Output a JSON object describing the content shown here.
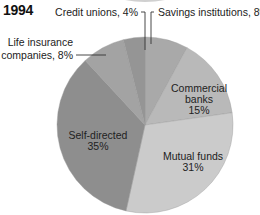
{
  "title": "1994",
  "chart_data": {
    "type": "pie",
    "title": "1994",
    "start_angle_deg": 0,
    "direction": "clockwise",
    "slices": [
      {
        "label": "Savings institutions",
        "value": 8,
        "display": "Savings institutions, 8%",
        "color": "#a9a9a9",
        "label_position": "outside"
      },
      {
        "label": "Commercial banks",
        "value": 15,
        "display": "Commercial banks 15%",
        "color": "#b9b9b9",
        "label_position": "inside"
      },
      {
        "label": "Mutual funds",
        "value": 31,
        "display": "Mutual funds 31%",
        "color": "#cbcbcb",
        "label_position": "inside"
      },
      {
        "label": "Self-directed",
        "value": 35,
        "display": "Self-directed 35%",
        "color": "#8e8e8e",
        "label_position": "inside"
      },
      {
        "label": "Life insurance companies",
        "value": 8,
        "display": "Life insurance companies, 8%",
        "color": "#a3a3a3",
        "label_position": "outside"
      },
      {
        "label": "Credit unions",
        "value": 4,
        "display": "Credit unions, 4%",
        "color": "#959595",
        "label_position": "outside"
      }
    ],
    "units": "%",
    "legend": "none"
  },
  "labels": {
    "savings": "Savings institutions, 8%",
    "credit": "Credit unions, 4%",
    "life_line1": "Life insurance",
    "life_line2": "companies, 8%",
    "commercial_line1": "Commercial",
    "commercial_line2": "banks",
    "commercial_line3": "15%",
    "mutual_line1": "Mutual funds",
    "mutual_line2": "31%",
    "self_line1": "Self-directed",
    "self_line2": "35%"
  }
}
